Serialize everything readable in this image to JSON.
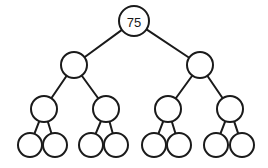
{
  "diagram": {
    "type": "binary-tree",
    "depth": 4,
    "root": {
      "label": "75",
      "cx": 134,
      "cy": 21,
      "r": 15
    },
    "nodes": [
      {
        "id": "root",
        "label": "75",
        "cx": 134,
        "cy": 21,
        "r": 15,
        "parent": null
      },
      {
        "id": "n1",
        "label": "",
        "cx": 74,
        "cy": 65,
        "r": 13,
        "parent": "root"
      },
      {
        "id": "n2",
        "label": "",
        "cx": 200,
        "cy": 65,
        "r": 13,
        "parent": "root"
      },
      {
        "id": "n3",
        "label": "",
        "cx": 44,
        "cy": 109,
        "r": 13,
        "parent": "n1"
      },
      {
        "id": "n4",
        "label": "",
        "cx": 106,
        "cy": 109,
        "r": 13,
        "parent": "n1"
      },
      {
        "id": "n5",
        "label": "",
        "cx": 168,
        "cy": 109,
        "r": 13,
        "parent": "n2"
      },
      {
        "id": "n6",
        "label": "",
        "cx": 230,
        "cy": 109,
        "r": 13,
        "parent": "n2"
      },
      {
        "id": "n7",
        "label": "",
        "cx": 30,
        "cy": 145,
        "r": 12,
        "parent": "n3"
      },
      {
        "id": "n8",
        "label": "",
        "cx": 55,
        "cy": 145,
        "r": 12,
        "parent": "n3"
      },
      {
        "id": "n9",
        "label": "",
        "cx": 91,
        "cy": 145,
        "r": 12,
        "parent": "n4"
      },
      {
        "id": "n10",
        "label": "",
        "cx": 116,
        "cy": 145,
        "r": 12,
        "parent": "n4"
      },
      {
        "id": "n11",
        "label": "",
        "cx": 154,
        "cy": 145,
        "r": 12,
        "parent": "n5"
      },
      {
        "id": "n12",
        "label": "",
        "cx": 179,
        "cy": 145,
        "r": 12,
        "parent": "n5"
      },
      {
        "id": "n13",
        "label": "",
        "cx": 216,
        "cy": 145,
        "r": 12,
        "parent": "n6"
      },
      {
        "id": "n14",
        "label": "",
        "cx": 242,
        "cy": 145,
        "r": 12,
        "parent": "n6"
      }
    ],
    "colors": {
      "stroke": "#1a1a1a",
      "fill": "#ffffff",
      "background": "#ffffff"
    }
  }
}
